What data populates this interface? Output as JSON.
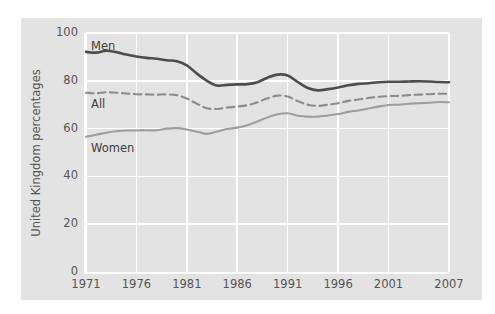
{
  "chart_data": {
    "type": "line",
    "title": "",
    "xlabel": "",
    "ylabel": "United Kingdom percentages",
    "xlim": [
      1971,
      2007
    ],
    "ylim": [
      0,
      100
    ],
    "yticks": [
      0,
      20,
      40,
      60,
      80,
      100
    ],
    "xticks": [
      1971,
      1976,
      1981,
      1986,
      1991,
      1996,
      2001,
      2007
    ],
    "grid": true,
    "legend_position": "inline-annotations",
    "x": [
      1971,
      1972,
      1973,
      1974,
      1975,
      1976,
      1977,
      1978,
      1979,
      1980,
      1981,
      1982,
      1983,
      1984,
      1985,
      1986,
      1987,
      1988,
      1989,
      1990,
      1991,
      1992,
      1993,
      1994,
      1995,
      1996,
      1997,
      1998,
      1999,
      2000,
      2001,
      2002,
      2003,
      2004,
      2005,
      2006,
      2007
    ],
    "series": [
      {
        "name": "Men",
        "color": "#4d4d4d",
        "style": "solid",
        "values": [
          92.1,
          91.8,
          92.6,
          92.0,
          91.0,
          90.2,
          89.6,
          89.2,
          88.6,
          88.2,
          86.5,
          83.0,
          80.0,
          78.0,
          78.3,
          78.5,
          78.6,
          79.4,
          81.3,
          82.6,
          82.2,
          79.5,
          77.0,
          76.0,
          76.5,
          77.2,
          78.1,
          78.7,
          79.0,
          79.4,
          79.6,
          79.6,
          79.7,
          79.8,
          79.7,
          79.5,
          79.4
        ]
      },
      {
        "name": "All",
        "color": "#8c8c8c",
        "style": "dashed",
        "values": [
          75.0,
          74.8,
          75.2,
          75.0,
          74.7,
          74.4,
          74.3,
          74.2,
          74.3,
          74.0,
          72.6,
          70.4,
          68.5,
          68.2,
          68.8,
          69.2,
          69.8,
          71.0,
          72.7,
          73.8,
          73.4,
          71.5,
          70.0,
          69.5,
          70.0,
          70.6,
          71.6,
          72.2,
          72.8,
          73.3,
          73.6,
          73.7,
          74.0,
          74.2,
          74.4,
          74.6,
          74.6
        ]
      },
      {
        "name": "Women",
        "color": "#9e9e9e",
        "style": "solid",
        "values": [
          56.6,
          57.4,
          58.3,
          58.9,
          59.2,
          59.2,
          59.3,
          59.3,
          60.0,
          60.2,
          59.6,
          58.7,
          57.8,
          58.8,
          59.8,
          60.4,
          61.4,
          63.0,
          64.7,
          66.0,
          66.4,
          65.4,
          65.0,
          65.0,
          65.5,
          66.1,
          67.0,
          67.6,
          68.4,
          69.2,
          69.9,
          70.0,
          70.4,
          70.6,
          70.8,
          71.1,
          71.0
        ]
      }
    ]
  },
  "axes": {
    "y_label": "United Kingdom percentages",
    "y_tick_labels": [
      "100",
      "80",
      "60",
      "40",
      "20",
      "0"
    ],
    "x_tick_labels": [
      "1971",
      "1976",
      "1981",
      "1986",
      "1991",
      "1996",
      "2001",
      "2007"
    ]
  },
  "annotations": {
    "men": "Men",
    "all": "All",
    "women": "Women"
  },
  "colors": {
    "panel_background": "#e3e3e3",
    "grid": "#ffffff",
    "men_line": "#4d4d4d",
    "all_line": "#8c8c8c",
    "women_line": "#9e9e9e",
    "tick_text": "#555555"
  }
}
